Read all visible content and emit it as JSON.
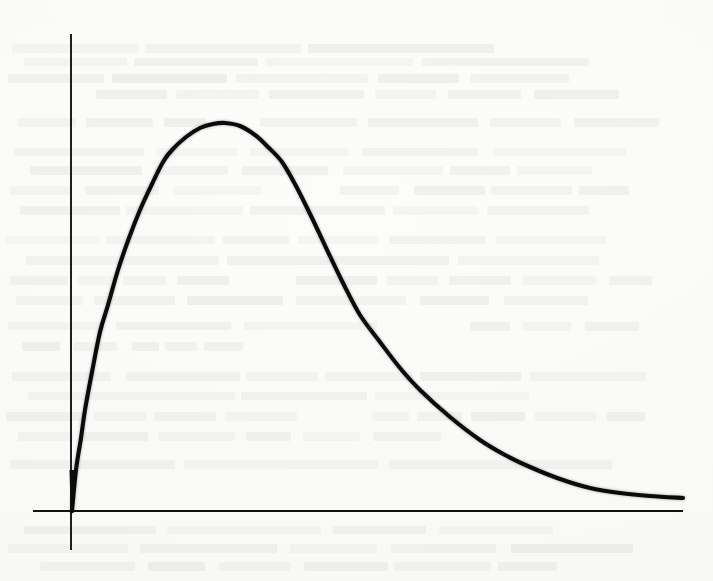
{
  "figure": {
    "kind": "scanned-book-figure",
    "medium": "grayscale page scan with reverse-side ink bleed-through",
    "background_color": "#fdfdfc",
    "ink_color": "#0b0b0b",
    "axis_color": "#121212",
    "visible_text": "",
    "title": "",
    "caption": "",
    "labels": []
  },
  "canvas": {
    "width": 713,
    "height": 581
  },
  "axes": {
    "x_axis": {
      "name": "horizontal-axis",
      "y_pixel": 511,
      "x_start_pixel": 33,
      "x_end_pixel": 683,
      "tick_labels": [],
      "label": "",
      "stroke_width": 1.9
    },
    "y_axis": {
      "name": "vertical-axis",
      "x_pixel": 71,
      "y_top_pixel": 34,
      "y_bottom_pixel": 550,
      "tick_labels": [],
      "label": "",
      "stroke_width": 1.9
    },
    "origin_pixel": [
      71,
      511
    ],
    "grid": false,
    "legend": false,
    "frame": false
  },
  "chart_data": {
    "type": "line",
    "title": "",
    "subtitle": "",
    "xlabel": "",
    "ylabel": "",
    "xlim": [
      0,
      1
    ],
    "ylim": [
      0,
      1
    ],
    "grid": false,
    "legend_position": "none",
    "annotations": [],
    "tick_labels_x": [],
    "tick_labels_y": [],
    "series": [
      {
        "name": "density-curve",
        "color": "#0b0b0b",
        "line_width_px": 4.1,
        "pixel_points": [
          [
            72,
            511
          ],
          [
            76,
            470
          ],
          [
            81,
            438
          ],
          [
            85,
            410
          ],
          [
            92,
            372
          ],
          [
            100,
            332
          ],
          [
            108,
            305
          ],
          [
            118,
            270
          ],
          [
            129,
            238
          ],
          [
            140,
            210
          ],
          [
            152,
            184
          ],
          [
            163,
            162
          ],
          [
            172,
            150
          ],
          [
            186,
            137
          ],
          [
            200,
            128
          ],
          [
            213,
            124
          ],
          [
            225,
            123
          ],
          [
            240,
            126
          ],
          [
            255,
            135
          ],
          [
            268,
            147
          ],
          [
            282,
            162
          ],
          [
            296,
            186
          ],
          [
            312,
            218
          ],
          [
            328,
            252
          ],
          [
            344,
            285
          ],
          [
            360,
            315
          ],
          [
            380,
            342
          ],
          [
            400,
            368
          ],
          [
            420,
            390
          ],
          [
            450,
            417
          ],
          [
            480,
            440
          ],
          [
            505,
            455
          ],
          [
            530,
            467
          ],
          [
            560,
            479
          ],
          [
            590,
            488
          ],
          [
            620,
            493
          ],
          [
            650,
            496
          ],
          [
            683,
            498
          ]
        ],
        "normalized_points": [
          [
            0.0,
            0.0
          ],
          [
            0.021,
            0.213
          ],
          [
            0.051,
            0.412
          ],
          [
            0.092,
            0.567
          ],
          [
            0.133,
            0.688
          ],
          [
            0.164,
            0.76
          ],
          [
            0.215,
            0.852
          ],
          [
            0.251,
            0.916
          ],
          [
            0.282,
            0.955
          ],
          [
            0.318,
            0.976
          ],
          [
            0.354,
            0.998
          ],
          [
            0.395,
            0.99
          ],
          [
            0.436,
            0.961
          ],
          [
            0.467,
            0.925
          ],
          [
            0.508,
            0.86
          ],
          [
            0.559,
            0.746
          ],
          [
            0.61,
            0.652
          ],
          [
            0.744,
            0.467
          ],
          [
            0.816,
            0.373
          ],
          [
            0.9,
            0.3
          ],
          [
            1.0,
            0.26
          ]
        ]
      }
    ]
  },
  "bleed_through_lines": [
    {
      "x": 12,
      "y": 44,
      "w": 690,
      "strong": false
    },
    {
      "x": 24,
      "y": 58,
      "w": 664,
      "strong": true
    },
    {
      "x": 8,
      "y": 74,
      "w": 698,
      "strong": false
    },
    {
      "x": 96,
      "y": 90,
      "w": 560,
      "strong": false
    },
    {
      "x": 18,
      "y": 118,
      "w": 210,
      "strong": false
    },
    {
      "x": 260,
      "y": 118,
      "w": 430,
      "strong": false
    },
    {
      "x": 14,
      "y": 148,
      "w": 672,
      "strong": true
    },
    {
      "x": 30,
      "y": 166,
      "w": 648,
      "strong": false
    },
    {
      "x": 10,
      "y": 186,
      "w": 300,
      "strong": false
    },
    {
      "x": 340,
      "y": 186,
      "w": 348,
      "strong": false
    },
    {
      "x": 20,
      "y": 206,
      "w": 666,
      "strong": false
    },
    {
      "x": 6,
      "y": 236,
      "w": 684,
      "strong": true
    },
    {
      "x": 26,
      "y": 256,
      "w": 652,
      "strong": false
    },
    {
      "x": 10,
      "y": 276,
      "w": 242,
      "strong": false
    },
    {
      "x": 296,
      "y": 276,
      "w": 392,
      "strong": false
    },
    {
      "x": 16,
      "y": 296,
      "w": 668,
      "strong": false
    },
    {
      "x": 8,
      "y": 322,
      "w": 430,
      "strong": true
    },
    {
      "x": 470,
      "y": 322,
      "w": 218,
      "strong": false
    },
    {
      "x": 22,
      "y": 342,
      "w": 232,
      "strong": false
    },
    {
      "x": 12,
      "y": 372,
      "w": 676,
      "strong": false
    },
    {
      "x": 28,
      "y": 392,
      "w": 654,
      "strong": true
    },
    {
      "x": 6,
      "y": 412,
      "w": 318,
      "strong": false
    },
    {
      "x": 372,
      "y": 412,
      "w": 314,
      "strong": false
    },
    {
      "x": 18,
      "y": 432,
      "w": 500,
      "strong": false
    },
    {
      "x": 10,
      "y": 460,
      "w": 676,
      "strong": false
    },
    {
      "x": 24,
      "y": 526,
      "w": 662,
      "strong": true
    },
    {
      "x": 8,
      "y": 544,
      "w": 688,
      "strong": false
    },
    {
      "x": 40,
      "y": 562,
      "w": 604,
      "strong": false
    }
  ]
}
